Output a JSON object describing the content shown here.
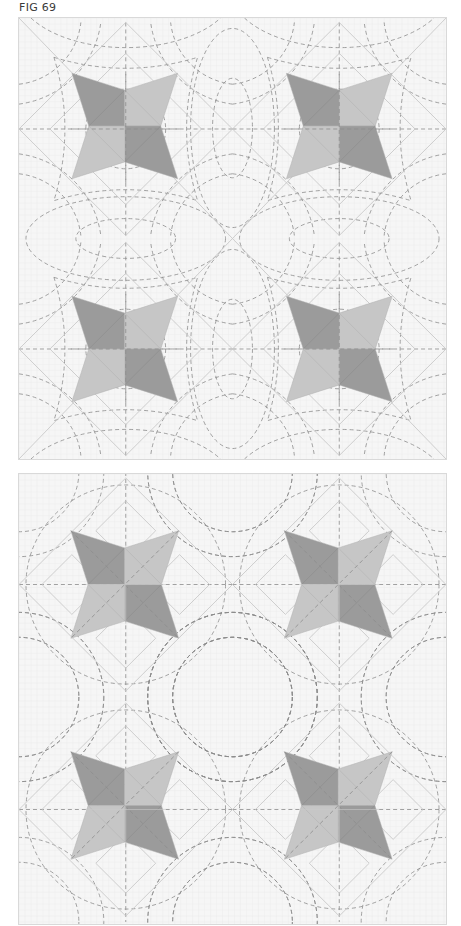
{
  "figure": {
    "label": "FIG 69",
    "colors": {
      "background": "#f6f6f6",
      "grid": "#ececec",
      "seam": "#c9c9c9",
      "quilting": "#8c8c8c",
      "star_dark": "#9b9b9b",
      "star_light": "#c6c6c6"
    },
    "panels": [
      {
        "id": "top",
        "description": "Star blocks set on point with orange-peel / curved crosshatch quilting",
        "layout": "on-point",
        "grid": {
          "cols": 2,
          "rows": 2,
          "block_w": 214,
          "block_h": 221
        },
        "stars": [
          {
            "row": 0,
            "col": 0,
            "dark": [
              "tl",
              "br"
            ],
            "light": [
              "tr",
              "bl"
            ]
          },
          {
            "row": 0,
            "col": 1,
            "dark": [
              "tl",
              "br"
            ],
            "light": [
              "tr",
              "bl"
            ]
          },
          {
            "row": 1,
            "col": 0,
            "dark": [
              "tl",
              "br"
            ],
            "light": [
              "tr",
              "bl"
            ]
          },
          {
            "row": 1,
            "col": 1,
            "dark": [
              "tl",
              "br"
            ],
            "light": [
              "tr",
              "bl"
            ]
          }
        ]
      },
      {
        "id": "bottom",
        "description": "Star blocks set straight with circular arc quilting and diagonal lines through stars",
        "layout": "straight",
        "grid": {
          "cols": 2,
          "rows": 2,
          "block_w": 214,
          "block_h": 226
        },
        "stars": [
          {
            "row": 0,
            "col": 0,
            "dark": [
              "tl",
              "br"
            ],
            "light": [
              "tr",
              "bl"
            ]
          },
          {
            "row": 0,
            "col": 1,
            "dark": [
              "tl",
              "br"
            ],
            "light": [
              "tr",
              "bl"
            ]
          },
          {
            "row": 1,
            "col": 0,
            "dark": [
              "tl",
              "br"
            ],
            "light": [
              "tr",
              "bl"
            ]
          },
          {
            "row": 1,
            "col": 1,
            "dark": [
              "tl",
              "br"
            ],
            "light": [
              "tr",
              "bl"
            ]
          }
        ]
      }
    ]
  }
}
